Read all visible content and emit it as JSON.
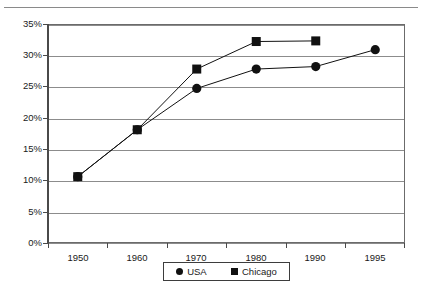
{
  "page": {
    "separator_name": "page-top-rule"
  },
  "chart_data": {
    "type": "line",
    "title": "",
    "subtitle": "",
    "xlabel": "",
    "ylabel": "",
    "categories": [
      "1950",
      "1960",
      "1970",
      "1980",
      "1990",
      "1995"
    ],
    "ylim": [
      0,
      35
    ],
    "y_unit": "%",
    "y_ticks": [
      "0%",
      "5%",
      "10%",
      "15%",
      "20%",
      "25%",
      "30%",
      "35%"
    ],
    "y_tick_values": [
      0,
      5,
      10,
      15,
      20,
      25,
      30,
      35
    ],
    "grid": true,
    "grid_axis": "y",
    "legend_position": "bottom",
    "series": [
      {
        "name": "USA",
        "marker": "circle",
        "color": "#111111",
        "values": [
          10.6,
          18.1,
          24.7,
          27.8,
          28.2,
          30.9
        ]
      },
      {
        "name": "Chicago",
        "marker": "square",
        "color": "#111111",
        "values": [
          10.6,
          18.1,
          27.8,
          32.2,
          32.3,
          null
        ]
      }
    ],
    "annotations": []
  },
  "legend": {
    "items": [
      {
        "label": "USA",
        "marker": "circle-marker"
      },
      {
        "label": "Chicago",
        "marker": "square-marker"
      }
    ]
  }
}
